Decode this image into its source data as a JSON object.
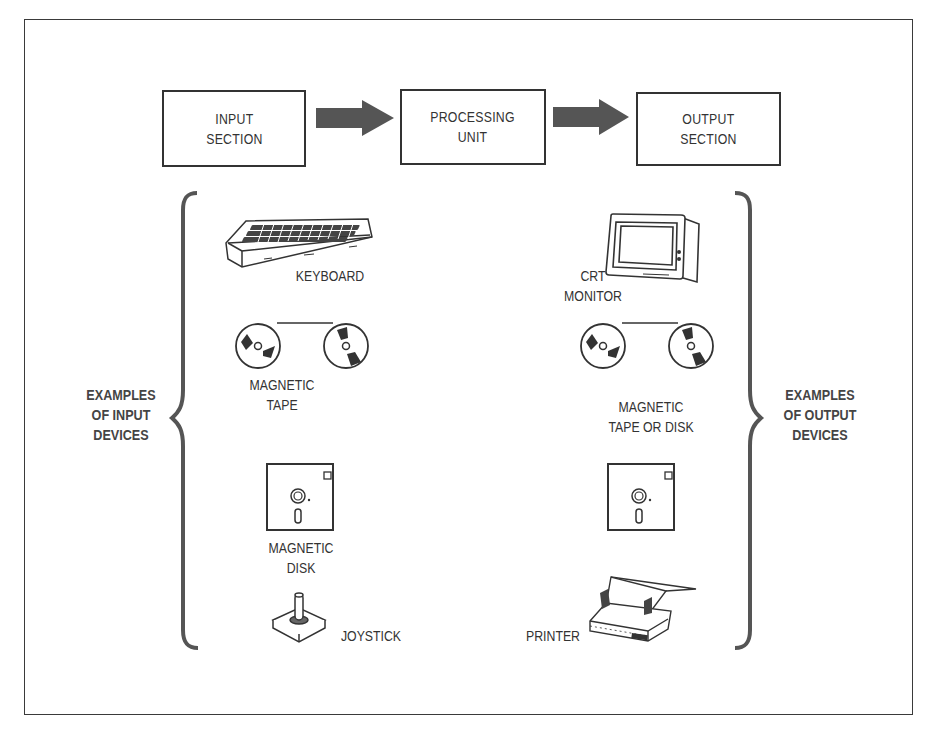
{
  "flow": {
    "input_section": "INPUT\nSECTION",
    "processing_unit": "PROCESSING\nUNIT",
    "output_section": "OUTPUT\nSECTION"
  },
  "groups": {
    "input_heading": "EXAMPLES\nOF INPUT\nDEVICES",
    "output_heading": "EXAMPLES\nOF OUTPUT\nDEVICES"
  },
  "input_devices": [
    {
      "name": "KEYBOARD",
      "icon": "keyboard-icon"
    },
    {
      "name": "MAGNETIC\nTAPE",
      "icon": "tape-reels-icon"
    },
    {
      "name": "MAGNETIC\nDISK",
      "icon": "floppy-disk-icon"
    },
    {
      "name": "JOYSTICK",
      "icon": "joystick-icon"
    }
  ],
  "output_devices": [
    {
      "name": "CRT\nMONITOR",
      "icon": "crt-monitor-icon"
    },
    {
      "name": "MAGNETIC\nTAPE OR DISK",
      "icon": "tape-reels-icon"
    },
    {
      "name": "",
      "icon": "floppy-disk-icon"
    },
    {
      "name": "PRINTER",
      "icon": "printer-icon"
    }
  ],
  "colors": {
    "line": "#333333",
    "arrow_fill": "#555555",
    "background": "#ffffff"
  }
}
